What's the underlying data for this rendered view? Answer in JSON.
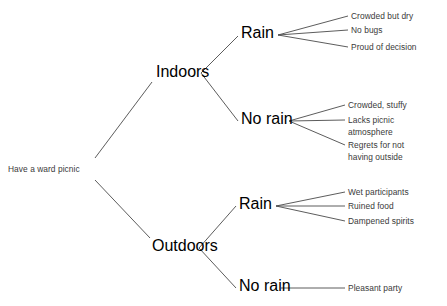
{
  "diagram": {
    "type": "decision-tree",
    "root": {
      "label": "Have a ward picnic"
    },
    "decisions": [
      {
        "label": "Indoors"
      },
      {
        "label": "Outdoors"
      }
    ],
    "chance_nodes": [
      {
        "label": "Rain",
        "parent": "Indoors"
      },
      {
        "label": "No rain",
        "parent": "Indoors"
      },
      {
        "label": "Rain",
        "parent": "Outdoors"
      },
      {
        "label": "No rain",
        "parent": "Outdoors"
      }
    ],
    "outcomes": {
      "indoors_rain": [
        {
          "line1": "Crowded but dry",
          "line2": ""
        },
        {
          "line1": "No bugs",
          "line2": ""
        },
        {
          "line1": "Proud of decision",
          "line2": ""
        }
      ],
      "indoors_norain": [
        {
          "line1": "Crowded, stuffy",
          "line2": ""
        },
        {
          "line1": "Lacks picnic",
          "line2": "atmosphere"
        },
        {
          "line1": "Regrets for not",
          "line2": "having outside"
        }
      ],
      "outdoors_rain": [
        {
          "line1": "Wet participants",
          "line2": ""
        },
        {
          "line1": "Ruined food",
          "line2": ""
        },
        {
          "line1": "Dampened spirits",
          "line2": ""
        }
      ],
      "outdoors_norain": [
        {
          "line1": "Pleasant party",
          "line2": ""
        }
      ]
    },
    "colors": {
      "background": "#ffffff",
      "line": "#4a4a4a",
      "text": "#3a3a3a"
    }
  }
}
